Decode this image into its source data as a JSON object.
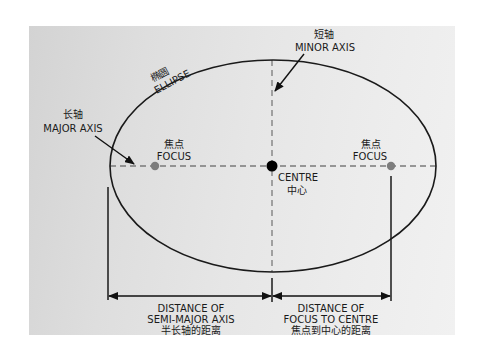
{
  "diagram": {
    "colors": {
      "background": "#ffffff",
      "panel": "#e2e2e2",
      "line": "#1a1a1a",
      "dashed_axis": "#7a7a7a",
      "focus_dot": "#7d7d7d",
      "centre_dot": "#000000"
    },
    "ellipse": {
      "label_cn": "椭圆",
      "label_en": "ELLIPSE"
    },
    "major_axis": {
      "label_cn": "长轴",
      "label_en": "MAJOR AXIS"
    },
    "minor_axis": {
      "label_cn": "短轴",
      "label_en": "MINOR AXIS"
    },
    "focus_left": {
      "label_cn": "焦点",
      "label_en": "FOCUS"
    },
    "focus_right": {
      "label_cn": "焦点",
      "label_en": "FOCUS"
    },
    "centre": {
      "label_en": "CENTRE",
      "label_cn": "中心"
    },
    "semi_major_distance": {
      "line1": "DISTANCE OF",
      "line2": "SEMI-MAJOR AXIS",
      "line3_cn": "半长轴的距离"
    },
    "focus_centre_distance": {
      "line1": "DISTANCE OF",
      "line2": "FOCUS TO CENTRE",
      "line3_cn": "焦点到中心的距离"
    }
  }
}
